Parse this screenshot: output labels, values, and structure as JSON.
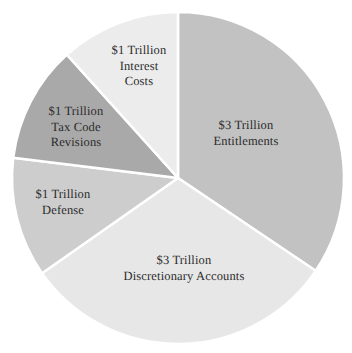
{
  "chart_data": {
    "type": "pie",
    "title": "",
    "subtitle": "",
    "xlabel": "",
    "ylabel": "",
    "legend_position": "none",
    "grid": false,
    "unit": "Trillion",
    "currency": "$",
    "total_value": 9,
    "categories": [
      "Entitlements",
      "Discretionary Accounts",
      "Defense",
      "Tax Code Revisions",
      "Interest Costs"
    ],
    "values": [
      3,
      3,
      1,
      1,
      1
    ],
    "slices": [
      {
        "id": "entitlements",
        "amount_label": "$3 Trillion",
        "name_label": "Entitlements",
        "value": 3,
        "percent": 33.3,
        "start_angle": 0,
        "end_angle": 124,
        "color": "#c2c2c2",
        "label_lines": [
          "$3 Trillion",
          "Entitlements"
        ]
      },
      {
        "id": "discretionary",
        "amount_label": "$3 Trillion",
        "name_label": "Discretionary Accounts",
        "value": 3,
        "percent": 33.3,
        "start_angle": 124,
        "end_angle": 235,
        "color": "#e7e7e7",
        "label_lines": [
          "$3 Trillion",
          "Discretionary Accounts"
        ]
      },
      {
        "id": "defense",
        "amount_label": "$1 Trillion",
        "name_label": "Defense",
        "value": 1,
        "percent": 11.1,
        "start_angle": 235,
        "end_angle": 277,
        "color": "#cdcdcd",
        "label_lines": [
          "$1 Trillion",
          "Defense"
        ]
      },
      {
        "id": "taxcode",
        "amount_label": "$1 Trillion",
        "name_label": "Tax Code Revisions",
        "value": 1,
        "percent": 11.1,
        "start_angle": 277,
        "end_angle": 318,
        "color": "#a9a9a9",
        "label_lines": [
          "$1 Trillion",
          "Tax Code",
          "Revisions"
        ]
      },
      {
        "id": "interest",
        "amount_label": "$1 Trillion",
        "name_label": "Interest Costs",
        "value": 1,
        "percent": 11.1,
        "start_angle": 318,
        "end_angle": 360,
        "color": "#ececec",
        "label_lines": [
          "$1 Trillion",
          "Interest",
          "Costs"
        ]
      }
    ],
    "geometry": {
      "center_x": 178,
      "center_y": 178,
      "radius": 166,
      "separator_color": "#ffffff",
      "separator_width": 2.5,
      "background": "#ffffff"
    }
  }
}
